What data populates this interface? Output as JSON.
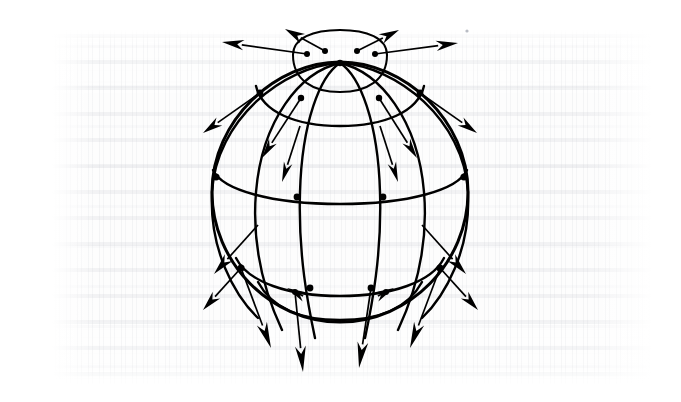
{
  "figure": {
    "name": "sphere-vector-field",
    "title": "Sphere with latitude-longitude grid and outward radial vectors",
    "caption": "",
    "background_color": "#ffffff",
    "ink_color": "#000000",
    "texture_color": "#a4a8b2",
    "geometry": {
      "center_x": 340,
      "center_y": 192,
      "radius_x": 128,
      "radius_y": 130,
      "pole_x": 340,
      "pole_y": 63,
      "meridian_count": 6,
      "parallel_count": 5,
      "vector_count": 20
    },
    "labels": {
      "sphere": "sphere",
      "meridians": "meridians",
      "parallels": "parallels",
      "vectors": "outward vectors",
      "pole": "north pole"
    },
    "outline": "M 340 62 C 404 62 468 120 468 192 C 468 262 410 322 340 322 C 270 322 212 262 212 192 C 212 120 276 62 340 62 Z",
    "meridians": [
      {
        "name": "meridian-1-left-limb",
        "d": "M 340 63 C 283 66 216 120 212 192 C 209 250 235 296 258 318"
      },
      {
        "name": "meridian-2",
        "d": "M 340 63 C 300 72 262 120 256 192 C 251 252 268 300 282 330"
      },
      {
        "name": "meridian-3",
        "d": "M 340 63 C 320 76 302 122 300 192 C 298 254 308 305 315 338"
      },
      {
        "name": "meridian-4",
        "d": "M 340 63 C 360 76 378 122 380 192 C 382 254 372 305 365 338"
      },
      {
        "name": "meridian-5",
        "d": "M 340 63 C 380 72 418 120 424 192 C 429 252 412 300 398 330"
      },
      {
        "name": "meridian-6-right-limb",
        "d": "M 340 63 C 397 66 464 120 468 192 C 471 250 445 296 422 318"
      }
    ],
    "parallels": [
      {
        "name": "parallel-polar-front",
        "d": "M 293 55 C 293 80 313 92 340 92 C 367 92 387 80 387 55"
      },
      {
        "name": "parallel-polar-back",
        "d": "M 293 55 C 293 38 313 30 340 30 C 367 30 387 38 387 55"
      },
      {
        "name": "parallel-upper-front",
        "d": "M 256 86 C 262 112 296 126 340 126 C 384 126 418 112 424 86"
      },
      {
        "name": "parallel-mid-front",
        "d": "M 213 170 C 222 190 272 204 340 204 C 408 204 458 190 467 170"
      },
      {
        "name": "parallel-lower-front",
        "d": "M 236 258 C 248 282 288 296 340 296 C 392 296 432 282 444 258"
      },
      {
        "name": "parallel-bottom-front",
        "d": "M 258 282 C 272 308 300 320 340 320 C 380 320 408 308 422 282"
      }
    ],
    "nodes": [
      {
        "name": "node-pole",
        "cx": 340,
        "cy": 63,
        "r": 3.2
      },
      {
        "name": "node-polar-1",
        "cx": 307,
        "cy": 54,
        "r": 3.0
      },
      {
        "name": "node-polar-2",
        "cx": 325,
        "cy": 51,
        "r": 3.0
      },
      {
        "name": "node-polar-3",
        "cx": 357,
        "cy": 51,
        "r": 3.0
      },
      {
        "name": "node-polar-4",
        "cx": 375,
        "cy": 54,
        "r": 3.0
      },
      {
        "name": "node-upper-1",
        "cx": 260,
        "cy": 93,
        "r": 3.4
      },
      {
        "name": "node-upper-2",
        "cx": 301,
        "cy": 98,
        "r": 3.2
      },
      {
        "name": "node-upper-3",
        "cx": 379,
        "cy": 98,
        "r": 3.2
      },
      {
        "name": "node-upper-4",
        "cx": 420,
        "cy": 93,
        "r": 3.4
      },
      {
        "name": "node-mid-1",
        "cx": 216,
        "cy": 177,
        "r": 3.6
      },
      {
        "name": "node-mid-2",
        "cx": 297,
        "cy": 197,
        "r": 3.4
      },
      {
        "name": "node-mid-3",
        "cx": 383,
        "cy": 197,
        "r": 3.4
      },
      {
        "name": "node-mid-4",
        "cx": 464,
        "cy": 177,
        "r": 3.6
      },
      {
        "name": "node-lower-1",
        "cx": 241,
        "cy": 268,
        "r": 3.6
      },
      {
        "name": "node-lower-2",
        "cx": 310,
        "cy": 288,
        "r": 3.4
      },
      {
        "name": "node-lower-3",
        "cx": 371,
        "cy": 288,
        "r": 3.4
      },
      {
        "name": "node-lower-4",
        "cx": 440,
        "cy": 268,
        "r": 3.6
      },
      {
        "name": "node-bottom-1",
        "cx": 295,
        "cy": 292,
        "r": 3.0
      },
      {
        "name": "node-bottom-2",
        "cx": 386,
        "cy": 292,
        "r": 3.0
      }
    ],
    "vectors": [
      {
        "name": "vector-top-left-outer",
        "x1": 307,
        "y1": 54,
        "x2": 222,
        "y2": 42,
        "w": 5.2,
        "hl": 22
      },
      {
        "name": "vector-top-left-upper",
        "x1": 325,
        "y1": 51,
        "x2": 285,
        "y2": 29,
        "w": 5.2,
        "hl": 20
      },
      {
        "name": "vector-top-right-upper",
        "x1": 357,
        "y1": 51,
        "x2": 399,
        "y2": 30,
        "w": 5.2,
        "hl": 20
      },
      {
        "name": "vector-top-right-outer",
        "x1": 375,
        "y1": 54,
        "x2": 458,
        "y2": 43,
        "w": 5.2,
        "hl": 22
      },
      {
        "name": "vector-upper-left-out",
        "x1": 260,
        "y1": 93,
        "x2": 203,
        "y2": 133,
        "w": 5.0,
        "hl": 20
      },
      {
        "name": "vector-upper-left-in",
        "x1": 301,
        "y1": 98,
        "x2": 262,
        "y2": 158,
        "w": 4.6,
        "hl": 20
      },
      {
        "name": "vector-upper-right-in",
        "x1": 379,
        "y1": 98,
        "x2": 417,
        "y2": 158,
        "w": 4.6,
        "hl": 20
      },
      {
        "name": "vector-upper-right-out",
        "x1": 420,
        "y1": 93,
        "x2": 477,
        "y2": 133,
        "w": 5.0,
        "hl": 20
      },
      {
        "name": "vector-mid-left-down",
        "x1": 300,
        "y1": 126,
        "x2": 282,
        "y2": 182,
        "w": 4.4,
        "hl": 20
      },
      {
        "name": "vector-mid-right-down",
        "x1": 380,
        "y1": 126,
        "x2": 398,
        "y2": 182,
        "w": 4.4,
        "hl": 20
      },
      {
        "name": "vector-low-left-limb",
        "x1": 258,
        "y1": 225,
        "x2": 214,
        "y2": 274,
        "w": 5.2,
        "hl": 22
      },
      {
        "name": "vector-low-right-limb",
        "x1": 422,
        "y1": 225,
        "x2": 466,
        "y2": 274,
        "w": 5.2,
        "hl": 22
      },
      {
        "name": "vector-bottom-1",
        "x1": 241,
        "y1": 268,
        "x2": 203,
        "y2": 310,
        "w": 5.0,
        "hl": 20
      },
      {
        "name": "vector-bottom-2",
        "x1": 295,
        "y1": 292,
        "x2": 287,
        "y2": 288,
        "w": 5.0,
        "hl": 20
      },
      {
        "name": "vector-bottom-3",
        "x1": 386,
        "y1": 292,
        "x2": 394,
        "y2": 288,
        "w": 5.0,
        "hl": 20
      },
      {
        "name": "vector-bottom-4",
        "x1": 440,
        "y1": 268,
        "x2": 478,
        "y2": 310,
        "w": 5.0,
        "hl": 20
      },
      {
        "name": "vector-bottom-long-1",
        "x1": 241,
        "y1": 268,
        "x2": 271,
        "y2": 348,
        "w": 5.4,
        "hl": 26
      },
      {
        "name": "vector-bottom-long-2",
        "x1": 295,
        "y1": 292,
        "x2": 303,
        "y2": 372,
        "w": 5.4,
        "hl": 26
      },
      {
        "name": "vector-bottom-long-3",
        "x1": 371,
        "y1": 288,
        "x2": 359,
        "y2": 368,
        "w": 5.4,
        "hl": 26
      },
      {
        "name": "vector-bottom-long-4",
        "x1": 440,
        "y1": 268,
        "x2": 410,
        "y2": 348,
        "w": 5.4,
        "hl": 26
      }
    ],
    "speck": {
      "name": "scan-speck",
      "cx": 467,
      "cy": 31,
      "r": 1.6
    }
  }
}
